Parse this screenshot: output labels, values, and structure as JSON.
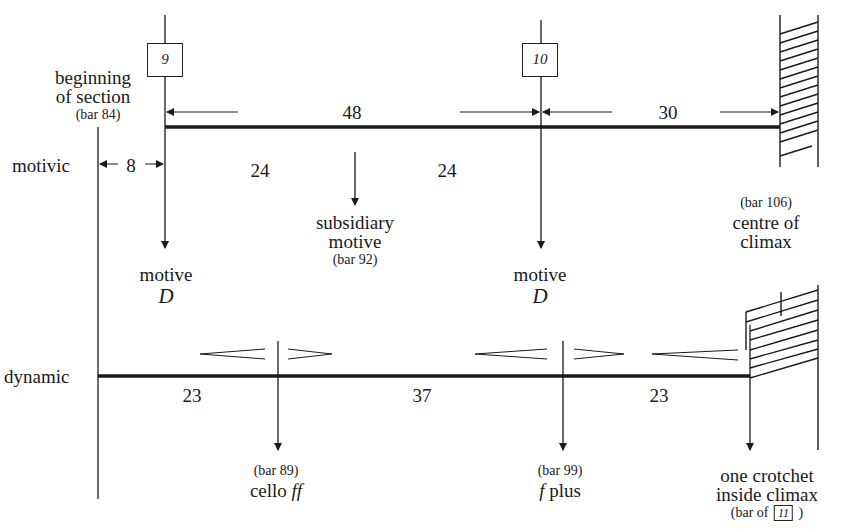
{
  "diagram": {
    "rows": {
      "motivic": {
        "label": "motivic"
      },
      "dynamic": {
        "label": "dynamic"
      }
    },
    "rehearsal_marks": [
      {
        "id": "9",
        "label": "9"
      },
      {
        "id": "10",
        "label": "10"
      }
    ],
    "motivic_annotations": {
      "beginning": {
        "line1": "beginning",
        "line2": "of section",
        "bar": "(bar 84)"
      },
      "span_8": "8",
      "span_48": "48",
      "span_30": "30",
      "span_24_left": "24",
      "span_24_right": "24",
      "subsidiary": {
        "line1": "subsidiary",
        "line2": "motive",
        "bar": "(bar 92)"
      },
      "motive_1": {
        "line1": "motive",
        "line2": "D"
      },
      "motive_2": {
        "line1": "motive",
        "line2": "D"
      },
      "climax": {
        "bar": "(bar 106)",
        "line1": "centre of",
        "line2": "climax"
      }
    },
    "dynamic_annotations": {
      "span_23_left": "23",
      "span_37": "37",
      "span_23_right": "23",
      "cello": {
        "bar": "(bar 89)",
        "text": "cello",
        "dyn": "ff"
      },
      "fplus": {
        "bar": "(bar 99)",
        "dyn": "f",
        "text": "plus"
      },
      "crotchet": {
        "line1": "one crotchet",
        "line2": "inside climax",
        "bar_prefix": "(bar of",
        "box": "11",
        "bar_suffix": ")"
      }
    },
    "colors": {
      "ink": "#1a1a1a",
      "background": "#ffffff"
    }
  }
}
